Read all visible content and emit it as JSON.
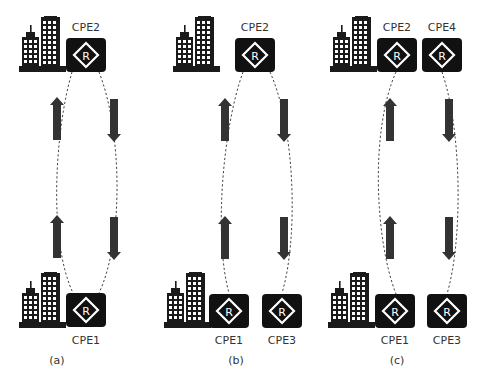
{
  "figure": {
    "panels": [
      {
        "id": "a",
        "caption": "(a)",
        "top_devices": [
          {
            "label": "CPE2"
          }
        ],
        "bottom_devices": [
          {
            "label": "CPE1"
          }
        ],
        "description": "Single loop between CPE2 and CPE1: upstream arrows on left, downstream arrows on right"
      },
      {
        "id": "b",
        "caption": "(b)",
        "top_devices": [
          {
            "label": "CPE2"
          }
        ],
        "bottom_devices": [
          {
            "label": "CPE1"
          },
          {
            "label": "CPE3"
          }
        ],
        "description": "CPE2 connects down to CPE1 and CPE3"
      },
      {
        "id": "c",
        "caption": "(c)",
        "top_devices": [
          {
            "label": "CPE2"
          },
          {
            "label": "CPE4"
          }
        ],
        "bottom_devices": [
          {
            "label": "CPE1"
          },
          {
            "label": "CPE3"
          }
        ],
        "description": "CPE1 to CPE2 upstream, CPE4 to CPE3 downstream"
      }
    ],
    "router_glyph": "R",
    "colors": {
      "device_fill": "#111111",
      "building_fill": "#1a1a1a",
      "arrow_fill": "#333333",
      "link_stroke": "#444444",
      "label_text": "#333333",
      "background": "#ffffff"
    }
  }
}
